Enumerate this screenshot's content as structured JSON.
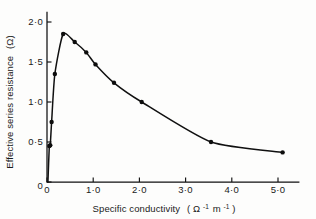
{
  "chart_data": {
    "type": "line",
    "title": "",
    "xlabel": "Specific conductivity (Ω⁻¹ m⁻¹)",
    "xlabel_text": "Specific conductivity",
    "xlabel_unit_open": "(",
    "xlabel_unit_omega": "Ω",
    "xlabel_unit_exp1": "-1",
    "xlabel_unit_m": "m",
    "xlabel_unit_exp2": "-1",
    "xlabel_unit_close": ")",
    "ylabel": "Effective series resistance (Ω)",
    "ylabel_text": "Effective series resistance",
    "ylabel_unit": "(Ω)",
    "xlim": [
      0,
      5.45
    ],
    "ylim": [
      0,
      2.12
    ],
    "xticks": [
      0,
      1.0,
      2.0,
      3.0,
      4.0,
      5.0
    ],
    "xtick_labels": [
      "0",
      "1·0",
      "2·0",
      "3·0",
      "4·0",
      "5·0"
    ],
    "yticks": [
      0,
      0.5,
      1.0,
      1.5,
      2.0
    ],
    "ytick_labels": [
      "0",
      "0·5",
      "1·0",
      "1·5",
      "2·0"
    ],
    "grid": false,
    "legend": "none",
    "marker": "filled-circle",
    "line_color": "#101010",
    "marker_color": "#0d0d0d",
    "axis_color": "#111111",
    "background_color": "#fdfdfc",
    "series": [
      {
        "name": "Effective series resistance vs specific conductivity",
        "x": [
          0.02,
          0.05,
          0.07,
          0.1,
          0.17,
          0.35,
          0.6,
          0.85,
          1.05,
          1.45,
          2.05,
          3.55,
          5.1
        ],
        "values": [
          0.0,
          0.45,
          0.46,
          0.75,
          1.35,
          1.85,
          1.75,
          1.62,
          1.47,
          1.24,
          1.0,
          0.5,
          0.37
        ]
      }
    ],
    "annotations": []
  }
}
